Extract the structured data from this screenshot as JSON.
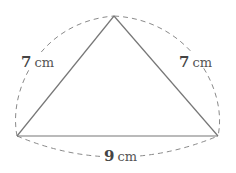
{
  "diagram": {
    "type": "isosceles-triangle",
    "vertices": {
      "apex": {
        "x": 114,
        "y": 16
      },
      "left": {
        "x": 17,
        "y": 136
      },
      "right": {
        "x": 218,
        "y": 136
      }
    },
    "labels": {
      "left_side": {
        "value": "7",
        "unit": "cm"
      },
      "right_side": {
        "value": "7",
        "unit": "cm"
      },
      "base": {
        "value": "9",
        "unit": "cm"
      }
    },
    "colors": {
      "solid_line": "#777777",
      "dashed_line": "#888888",
      "text": "#555555"
    }
  }
}
